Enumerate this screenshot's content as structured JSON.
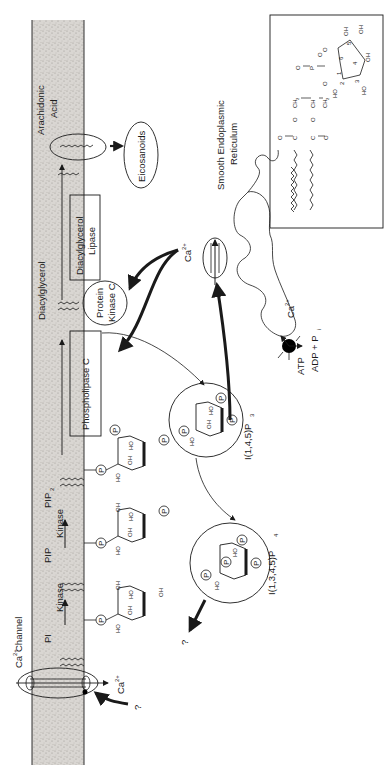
{
  "figure": {
    "orientation": "rotated-90-ccw"
  },
  "colors": {
    "membrane_fill": "#d6d3cf",
    "membrane_speckle": "#a8a49f",
    "ink": "#1a1a1a",
    "background": "#ffffff"
  },
  "membrane": {
    "lipid_labels": {
      "pi": "PI",
      "pip": "PIP",
      "pip2": "PIP",
      "pip2_sub": "2",
      "diacylglycerol": "Diacylglycerol",
      "arachidonic_acid_line1": "Arachidonic",
      "arachidonic_acid_line2": "Acid"
    },
    "kinase_labels": [
      "Kinase",
      "Kinase"
    ]
  },
  "enzymes": {
    "phospholipase_c": "Phospholipase  C",
    "dag_lipase_line1": "Diacylglycerol",
    "dag_lipase_line2": "Lipase",
    "protein_kinase_c_line1": "Protein",
    "protein_kinase_c_line2": "Kinase C"
  },
  "products": {
    "eicosanoids": "Eicosanoids",
    "ip3_label": "I(1,4,5)P",
    "ip3_sub": "3",
    "ip4_label": "I(1,3,4,5)P",
    "ip4_sub": "4",
    "unknown_fate": "?"
  },
  "calcium": {
    "channel_label": "Channel",
    "ion": "Ca",
    "ion_charge": "2+",
    "unknown_regulator": "?"
  },
  "er": {
    "label_line1": "Smooth Endoplasmic",
    "label_line2": "Reticulum",
    "pump_atp": "ATP",
    "pump_products": "ADP + P",
    "pump_products_sub": "i"
  },
  "sugar_ring": {
    "phosphate": "P",
    "hydroxyl": "OH",
    "hydroxyl_rev": "HO"
  },
  "inset": {
    "title": "Phosphatidylinositol structure",
    "atoms": {
      "carbonyl": "O",
      "c": "C",
      "ch2": "CH",
      "ch2_sub": "2",
      "ch": "CH",
      "o": "O",
      "p": "P",
      "oh": "OH",
      "ho": "HO",
      "ring_numbers": [
        "1",
        "2",
        "3",
        "4",
        "5",
        "6"
      ]
    }
  }
}
